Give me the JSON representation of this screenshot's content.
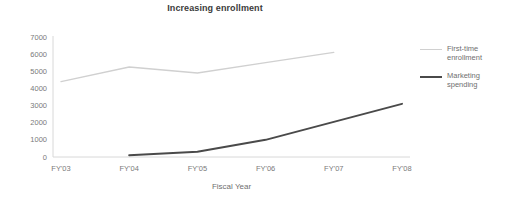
{
  "chart_data": {
    "type": "line",
    "title": "Increasing enrollment",
    "xlabel": "Fiscal Year",
    "ylabel": "",
    "categories": [
      "FY'03",
      "FY'04",
      "FY'05",
      "FY'06",
      "FY'07",
      "FY'08"
    ],
    "yticks": [
      0,
      1000,
      2000,
      3000,
      4000,
      5000,
      6000,
      7000
    ],
    "ylim": [
      0,
      7000
    ],
    "grid": false,
    "legend_position": "right",
    "series": [
      {
        "name": "First-time\nenrollment",
        "color": "#d0d0d0",
        "x": [
          "FY'03",
          "FY'04",
          "FY'05",
          "FY'06",
          "FY'07"
        ],
        "values": [
          4400,
          5250,
          4900,
          5500,
          6100
        ]
      },
      {
        "name": "Marketing\nspending",
        "color": "#4a4a4a",
        "x": [
          "FY'04",
          "FY'05",
          "FY'06",
          "FY'07",
          "FY'08"
        ],
        "values": [
          100,
          300,
          1000,
          2050,
          3100
        ]
      }
    ]
  },
  "colors": {
    "title": "#3b3b3b",
    "axis": "#d8d8d8",
    "tick_text": "#7a7a7a",
    "series_light": "#d0d0d0",
    "series_dark": "#4a4a4a",
    "background": "#ffffff"
  }
}
